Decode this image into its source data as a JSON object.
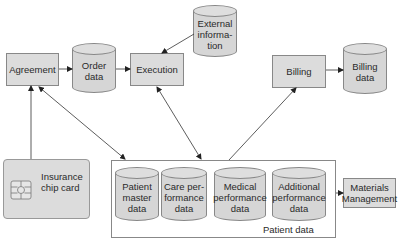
{
  "diagram": {
    "nodes": {
      "agreement": "Agreement",
      "order_data": [
        "Order",
        "data"
      ],
      "execution": "Execution",
      "external_information": [
        "External",
        "informa-",
        "tion"
      ],
      "billing": "Billing",
      "billing_data": [
        "Billing",
        "data"
      ],
      "insurance_card": [
        "Insurance",
        "chip card"
      ],
      "patient_master_data": [
        "Patient",
        "master",
        "data"
      ],
      "care_performance_data": [
        "Care per-",
        "formance",
        "data"
      ],
      "medical_performance_data": [
        "Medical",
        "performance",
        "data"
      ],
      "additional_performance_data": [
        "Additional",
        "performance",
        "data"
      ],
      "materials_management": [
        "Materials",
        "Management"
      ],
      "patient_data_label": "Patient data"
    },
    "edges": [
      {
        "from": "Agreement",
        "to": "Order data",
        "type": "arrow"
      },
      {
        "from": "Order data",
        "to": "Execution",
        "type": "arrow"
      },
      {
        "from": "External information",
        "to": "Execution",
        "type": "arrow"
      },
      {
        "from": "Billing",
        "to": "Billing data",
        "type": "arrow"
      },
      {
        "from": "Insurance chip card",
        "to": "Agreement",
        "type": "arrow"
      },
      {
        "from": "Agreement",
        "to": "Patient data",
        "type": "bidirectional"
      },
      {
        "from": "Execution",
        "to": "Patient data",
        "type": "bidirectional"
      },
      {
        "from": "Patient data",
        "to": "Billing",
        "type": "arrow"
      },
      {
        "from": "Patient data",
        "to": "Materials Management",
        "type": "arrow"
      }
    ],
    "colors": {
      "fill": "#dcdcdc",
      "stroke": "#888888",
      "line": "#333333"
    }
  }
}
